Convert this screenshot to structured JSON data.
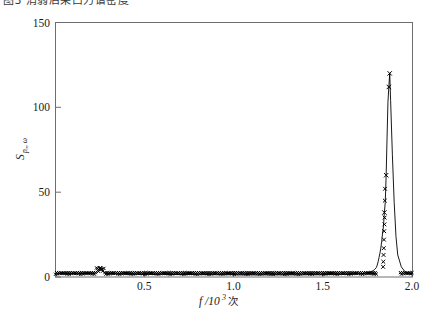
{
  "caption": {
    "clipped_text": "图3 消弱后采口力谱密度"
  },
  "chart_data": {
    "type": "line",
    "title": "",
    "subtitle": "",
    "xlabel": "f/10³ 次",
    "xlabel_parts": {
      "variable": "f",
      "divider": "/10",
      "exponent": "3",
      "unit": "次"
    },
    "ylabel": "Sₚₒ,ω",
    "ylabel_parts": {
      "symbol": "S",
      "subscript": "pₒ, ω"
    },
    "xlim": [
      0.0,
      2.0
    ],
    "ylim": [
      0,
      150
    ],
    "xticks": [
      0.5,
      1.0,
      1.5,
      2.0
    ],
    "xticklabels": [
      "0.5",
      "1.0",
      "1.5",
      "2.0"
    ],
    "yticks": [
      0,
      50,
      100,
      150
    ],
    "yticklabels": [
      "0",
      "50",
      "100",
      "150"
    ],
    "grid": false,
    "legend": null,
    "legend_position": "none",
    "marker": "x",
    "line_color": "#000000",
    "series": [
      {
        "name": "S_po,w",
        "x": [
          0.005,
          0.02,
          0.04,
          0.06,
          0.08,
          0.1,
          0.12,
          0.14,
          0.16,
          0.18,
          0.2,
          0.22,
          0.235,
          0.245,
          0.25,
          0.255,
          0.265,
          0.28,
          0.3,
          0.32,
          0.34,
          0.36,
          0.38,
          0.4,
          0.44,
          0.48,
          0.52,
          0.56,
          0.6,
          0.64,
          0.68,
          0.72,
          0.76,
          0.8,
          0.84,
          0.88,
          0.92,
          0.96,
          1.0,
          1.04,
          1.08,
          1.12,
          1.16,
          1.2,
          1.24,
          1.28,
          1.32,
          1.36,
          1.4,
          1.44,
          1.48,
          1.52,
          1.56,
          1.6,
          1.64,
          1.68,
          1.72,
          1.74,
          1.76,
          1.78,
          1.79,
          1.8,
          1.805,
          1.81,
          1.815,
          1.82,
          1.825,
          1.83,
          1.835,
          1.84,
          1.845,
          1.85,
          1.855,
          1.86,
          1.865,
          1.87,
          1.875,
          1.88,
          1.89,
          1.9,
          1.91,
          1.92,
          1.94,
          1.96,
          1.98,
          2.0
        ],
        "y": [
          1.6,
          2.0,
          1.8,
          2.2,
          1.9,
          2.1,
          1.8,
          2.3,
          2.0,
          1.9,
          2.2,
          2.4,
          3.4,
          4.6,
          5.2,
          4.4,
          3.2,
          2.4,
          2.0,
          1.8,
          1.9,
          1.7,
          1.8,
          1.6,
          1.7,
          1.5,
          1.6,
          1.5,
          1.6,
          1.4,
          1.5,
          1.4,
          1.5,
          1.3,
          1.4,
          1.3,
          1.4,
          1.3,
          1.4,
          1.2,
          1.3,
          1.2,
          1.3,
          1.2,
          1.3,
          1.2,
          1.3,
          1.2,
          1.3,
          1.4,
          1.3,
          1.5,
          1.4,
          1.6,
          1.5,
          1.8,
          2.0,
          2.4,
          2.8,
          3.6,
          4.4,
          5.6,
          7.0,
          9.0,
          11.5,
          14.0,
          17.0,
          21.0,
          26.0,
          30.0,
          38.0,
          44.0,
          60.0,
          82.0,
          103.0,
          112.0,
          120.0,
          104.0,
          72.0,
          44.0,
          24.0,
          13.0,
          6.0,
          3.2,
          2.0,
          1.6
        ]
      }
    ],
    "annotations": [
      {
        "label": "main-peak",
        "x": 1.875,
        "y": 120.0
      },
      {
        "label": "secondary-marker",
        "x": 1.87,
        "y": 112.0
      },
      {
        "label": "mid-marker",
        "x": 1.855,
        "y": 60.0
      },
      {
        "label": "low-marker",
        "x": 1.845,
        "y": 38.0
      },
      {
        "label": "small-bump",
        "x": 0.25,
        "y": 5.2
      }
    ]
  }
}
